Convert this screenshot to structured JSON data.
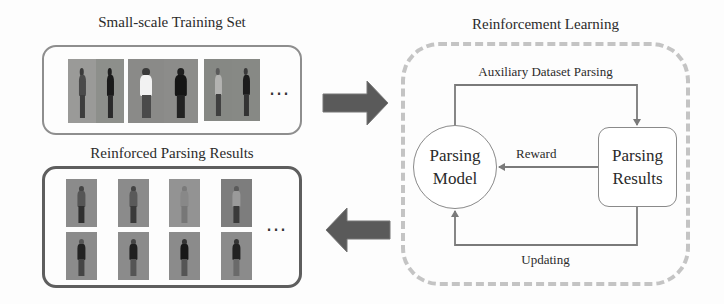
{
  "left": {
    "training_set": {
      "title": "Small-scale Training Set",
      "image_pairs": 3,
      "ellipsis": "…"
    },
    "parsing_results": {
      "title": "Reinforced Parsing Results",
      "rows": 2,
      "columns": 4,
      "ellipsis": "…"
    }
  },
  "arrows": {
    "to_rl": "right-arrow",
    "from_rl": "left-arrow"
  },
  "reinforcement_learning": {
    "title": "Reinforcement Learning",
    "nodes": {
      "model": {
        "line1": "Parsing",
        "line2": "Model"
      },
      "results": {
        "line1": "Parsing",
        "line2": "Results"
      }
    },
    "edges": {
      "top": "Auxiliary Dataset Parsing",
      "middle": "Reward",
      "bottom": "Updating"
    }
  },
  "colors": {
    "big_arrow": "#5a5a5a",
    "dashed_frame": "#c4c4c4",
    "flow_line": "#7a7a7a",
    "photo_bg": "#8b8b8b"
  }
}
